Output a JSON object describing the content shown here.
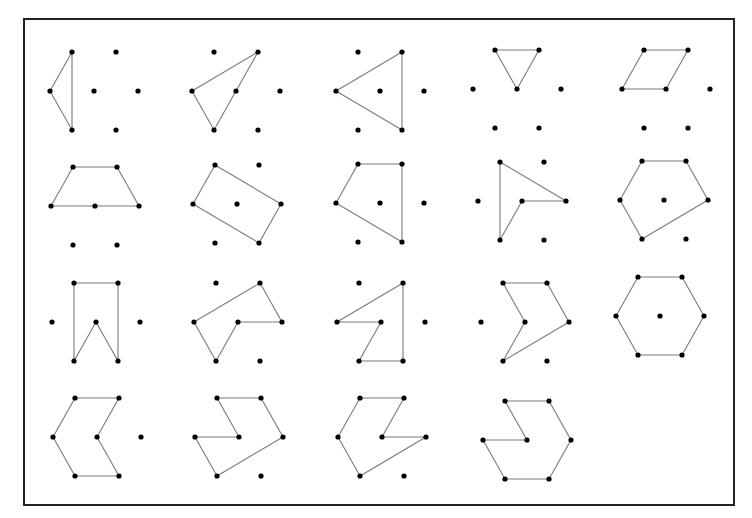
{
  "figure": {
    "frame": {
      "x": 24,
      "y": 19,
      "width": 710,
      "height": 486
    },
    "colors": {
      "frame": "#222222",
      "edge": "#7a7a7a",
      "dot": "#000000",
      "background": "#ffffff"
    },
    "lattice": {
      "dx": 44,
      "half_dx": 22,
      "dy": 39,
      "dot_radius": 2.6,
      "points": {
        "TL": [
          -22,
          -39
        ],
        "TR": [
          22,
          -39
        ],
        "ML": [
          -44,
          0
        ],
        "C": [
          0,
          0
        ],
        "MR": [
          44,
          0
        ],
        "BL": [
          -22,
          39
        ],
        "BR": [
          22,
          39
        ]
      }
    },
    "cells": [
      {
        "id": "r1c1",
        "row": 1,
        "col": 1,
        "center": [
          94,
          91
        ],
        "polygon": [
          "TL",
          "BL",
          "ML"
        ],
        "type": "triangle"
      },
      {
        "id": "r1c2",
        "row": 1,
        "col": 2,
        "center": [
          236,
          91
        ],
        "polygon": [
          "TR",
          "ML",
          "BL",
          "C"
        ],
        "type": "triangle"
      },
      {
        "id": "r1c3",
        "row": 1,
        "col": 3,
        "center": [
          380,
          91
        ],
        "polygon": [
          "TR",
          "BR",
          "ML"
        ],
        "type": "triangle"
      },
      {
        "id": "r1c4",
        "row": 1,
        "col": 4,
        "center": [
          517,
          89
        ],
        "polygon": [
          "TL",
          "TR",
          "C"
        ],
        "type": "triangle"
      },
      {
        "id": "r1c5",
        "row": 1,
        "col": 5,
        "center": [
          666,
          89
        ],
        "polygon": [
          "TL",
          "TR",
          "C",
          "ML"
        ],
        "type": "parallelogram"
      },
      {
        "id": "r2c1",
        "row": 2,
        "col": 1,
        "center": [
          95,
          206
        ],
        "polygon": [
          "TL",
          "TR",
          "MR",
          "C",
          "ML"
        ],
        "type": "trapezoid"
      },
      {
        "id": "r2c2",
        "row": 2,
        "col": 2,
        "center": [
          237,
          204
        ],
        "polygon": [
          "TL",
          "MR",
          "BR",
          "ML"
        ],
        "type": "rectangle"
      },
      {
        "id": "r2c3",
        "row": 2,
        "col": 3,
        "center": [
          380,
          203
        ],
        "polygon": [
          "TL",
          "TR",
          "BR",
          "ML"
        ],
        "type": "quadrilateral"
      },
      {
        "id": "r2c4",
        "row": 2,
        "col": 4,
        "center": [
          522,
          201
        ],
        "polygon": [
          "TL",
          "MR",
          "C",
          "BL"
        ],
        "type": "concave-quadrilateral"
      },
      {
        "id": "r2c5",
        "row": 2,
        "col": 5,
        "center": [
          664,
          200
        ],
        "polygon": [
          "TL",
          "TR",
          "MR",
          "BL",
          "ML"
        ],
        "type": "pentagon"
      },
      {
        "id": "r3c1",
        "row": 3,
        "col": 1,
        "center": [
          96,
          322
        ],
        "polygon": [
          "TL",
          "TR",
          "BR",
          "C",
          "BL"
        ],
        "type": "concave-pentagon"
      },
      {
        "id": "r3c2",
        "row": 3,
        "col": 2,
        "center": [
          238,
          322
        ],
        "polygon": [
          "TR",
          "MR",
          "C",
          "BL",
          "ML"
        ],
        "type": "concave-pentagon"
      },
      {
        "id": "r3c3",
        "row": 3,
        "col": 3,
        "center": [
          381,
          322
        ],
        "polygon": [
          "TR",
          "BR",
          "BL",
          "C",
          "ML"
        ],
        "type": "concave-pentagon"
      },
      {
        "id": "r3c4",
        "row": 3,
        "col": 4,
        "center": [
          525,
          322
        ],
        "polygon": [
          "TL",
          "TR",
          "MR",
          "BL",
          "C"
        ],
        "type": "concave-pentagon"
      },
      {
        "id": "r3c5",
        "row": 3,
        "col": 5,
        "center": [
          660,
          316
        ],
        "polygon": [
          "TL",
          "TR",
          "MR",
          "BR",
          "BL",
          "ML"
        ],
        "type": "regular-hexagon"
      },
      {
        "id": "r4c1",
        "row": 4,
        "col": 1,
        "center": [
          97,
          437
        ],
        "polygon": [
          "TL",
          "TR",
          "C",
          "BR",
          "BL",
          "ML"
        ],
        "type": "concave-hexagon"
      },
      {
        "id": "r4c2",
        "row": 4,
        "col": 2,
        "center": [
          239,
          437
        ],
        "polygon": [
          "TL",
          "TR",
          "MR",
          "BL",
          "ML",
          "C"
        ],
        "type": "concave-hexagon"
      },
      {
        "id": "r4c3",
        "row": 4,
        "col": 3,
        "center": [
          382,
          437
        ],
        "polygon": [
          "TL",
          "TR",
          "C",
          "MR",
          "BL",
          "ML"
        ],
        "type": "concave-hexagon"
      },
      {
        "id": "r4c4",
        "row": 4,
        "col": 4,
        "center": [
          527,
          440
        ],
        "polygon": [
          "TL",
          "TR",
          "MR",
          "BR",
          "BL",
          "ML",
          "C"
        ],
        "type": "concave-heptagon"
      }
    ]
  }
}
